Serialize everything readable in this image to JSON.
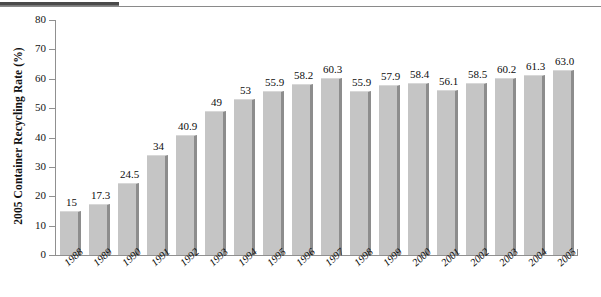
{
  "chart_data": {
    "type": "bar",
    "title": "",
    "xlabel": "",
    "ylabel": "2005 Container Recycling Rate (%)",
    "ylim": [
      0,
      80
    ],
    "yticks": [
      0,
      10,
      20,
      30,
      40,
      50,
      60,
      70,
      80
    ],
    "grid": false,
    "legend": false,
    "categories": [
      "1988",
      "1989",
      "1990",
      "1991",
      "1992",
      "1993",
      "1994",
      "1995",
      "1996",
      "1997",
      "1998",
      "1999",
      "2000",
      "2001",
      "2002",
      "2003",
      "2004",
      "2005"
    ],
    "values": [
      15,
      17.3,
      24.5,
      34,
      40.9,
      49,
      53,
      55.9,
      58.2,
      60.3,
      55.9,
      57.9,
      58.4,
      56.1,
      58.5,
      60.2,
      61.3,
      63.0
    ],
    "value_labels": [
      "15",
      "17.3",
      "24.5",
      "34",
      "40.9",
      "49",
      "53",
      "55.9",
      "58.2",
      "60.3",
      "55.9",
      "57.9",
      "58.4",
      "56.1",
      "58.5",
      "60.2",
      "61.3",
      "63.0"
    ],
    "bar_color": "#c5c5c5",
    "bar_shadow_color": "#8d8d8d",
    "axis_color": "#909090",
    "text_color": "#0d0d0d"
  }
}
